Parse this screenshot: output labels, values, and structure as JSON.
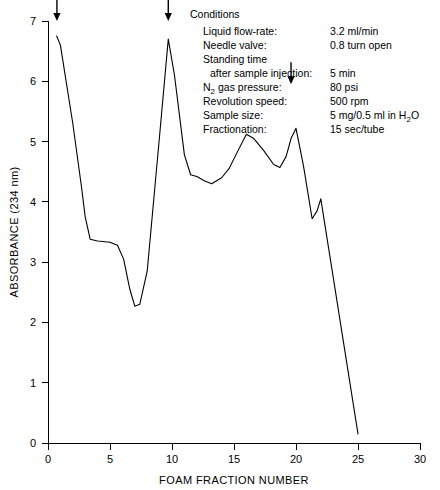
{
  "chart_data": {
    "type": "line",
    "title": "",
    "xlabel": "FOAM FRACTION NUMBER",
    "ylabel": "ABSORBANCE (234 nm)",
    "xlim": [
      0,
      30
    ],
    "ylim": [
      0,
      7
    ],
    "xticks": [
      0,
      5,
      10,
      15,
      20,
      25,
      30
    ],
    "yticks": [
      0,
      1,
      2,
      3,
      4,
      5,
      6,
      7
    ],
    "xtick_labels": [
      "0",
      "5",
      "10",
      "15",
      "20",
      "25",
      "30"
    ],
    "ytick_labels": [
      "0",
      "1",
      "2",
      "3",
      "4",
      "5",
      "6",
      "7"
    ],
    "grid": false,
    "legend": "none",
    "series": [
      {
        "name": "Absorbance at 234 nm",
        "x": [
          0.7,
          1.0,
          2.0,
          2.7,
          3.0,
          3.4,
          4.0,
          5.0,
          5.6,
          6.1,
          6.6,
          7.0,
          7.4,
          8.0,
          9.0,
          9.7,
          10.2,
          11.0,
          11.5,
          12.0,
          12.6,
          13.2,
          14.0,
          14.6,
          15.2,
          16.0,
          16.6,
          17.4,
          18.2,
          18.7,
          19.2,
          19.6,
          20.0,
          20.6,
          21.3,
          21.7,
          22.0,
          23.0,
          24.0,
          25.0
        ],
        "y": [
          6.75,
          6.6,
          5.3,
          4.25,
          3.75,
          3.38,
          3.35,
          3.33,
          3.28,
          3.05,
          2.55,
          2.27,
          2.3,
          2.85,
          5.1,
          6.7,
          6.1,
          4.78,
          4.45,
          4.42,
          4.35,
          4.3,
          4.4,
          4.55,
          4.8,
          5.12,
          5.05,
          4.85,
          4.62,
          4.57,
          4.75,
          5.05,
          5.22,
          4.6,
          3.72,
          3.85,
          4.05,
          2.75,
          1.45,
          0.15
        ]
      }
    ],
    "annotations": [
      {
        "type": "arrow",
        "label": "sample injection marker",
        "x": 0.72,
        "y": 7.0,
        "direction": "down"
      },
      {
        "type": "arrow",
        "label": "peak marker",
        "x": 9.7,
        "y": 7.0,
        "direction": "down"
      },
      {
        "type": "arrow",
        "label": "peak marker",
        "x": 19.6,
        "y": 5.95,
        "direction": "down"
      }
    ],
    "line_color": "#000000",
    "background_color": "#ffffff"
  },
  "conditions": {
    "heading": "Conditions",
    "rows": [
      {
        "label": "Liquid flow-rate:",
        "value": "3.2 ml/min"
      },
      {
        "label": "Needle valve:",
        "value": "0.8 turn open"
      },
      {
        "label": "Standing time",
        "value": ""
      },
      {
        "label": "after sample injection:",
        "value": "5 min",
        "indent": true
      },
      {
        "label": "N2 gas pressure:",
        "value": "80 psi",
        "subscript": "2",
        "label_prefix": "N",
        "label_suffix": " gas pressure:"
      },
      {
        "label": "Revolution speed:",
        "value": "500 rpm"
      },
      {
        "label": "Sample size:",
        "value": "5 mg/0.5 ml in H2O",
        "value_prefix": "5 mg/0.5 ml in H",
        "value_subscript": "2",
        "value_suffix": "O"
      },
      {
        "label": "Fractionation:",
        "value": "15 sec/tube"
      }
    ]
  }
}
